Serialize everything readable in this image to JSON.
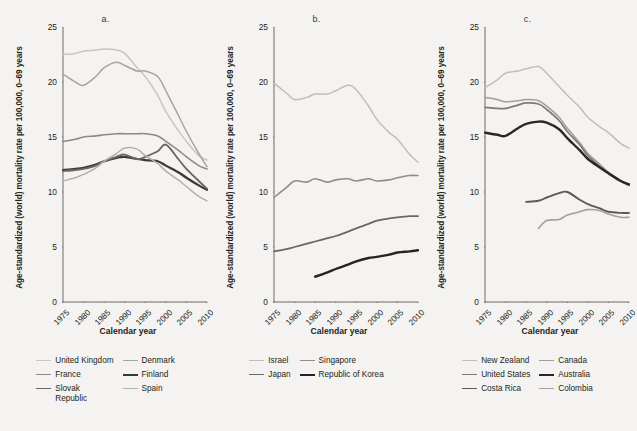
{
  "figure": {
    "background": "#f4f3f1",
    "axis_color": "#6f6b68"
  },
  "shared": {
    "ylabel": "Age-standardized (world) mortality rate per 100,000, 0–69 years",
    "xlabel": "Calendar year",
    "yticks": [
      "0",
      "5",
      "10",
      "15",
      "20",
      "25"
    ],
    "xticks": [
      "1975",
      "1980",
      "1985",
      "1990",
      "1995",
      "2000",
      "2005",
      "2010"
    ]
  },
  "panels": [
    {
      "id": "a",
      "label": "a."
    },
    {
      "id": "b",
      "label": "b."
    },
    {
      "id": "c",
      "label": "c."
    }
  ],
  "chart_data": [
    {
      "type": "line",
      "panel": "a.",
      "title": "a.",
      "xlabel": "Calendar year",
      "ylabel": "Age-standardized (world) mortality rate per 100,000, 0–69 years",
      "xlim": [
        1975,
        2010
      ],
      "ylim": [
        0,
        25
      ],
      "grid": false,
      "legend_position": "below",
      "x": [
        1975,
        1978,
        1980,
        1983,
        1985,
        1988,
        1990,
        1993,
        1995,
        1998,
        2000,
        2003,
        2005,
        2008,
        2010
      ],
      "series": [
        {
          "name": "United Kingdom",
          "color": "#c8c6c3",
          "values": [
            22.5,
            22.6,
            22.8,
            22.9,
            23.0,
            22.9,
            22.6,
            21.3,
            20.5,
            18.8,
            17.3,
            15.6,
            14.6,
            13.3,
            12.9
          ]
        },
        {
          "name": "Denmark",
          "color": "#a7a5a2",
          "values": [
            20.7,
            20.0,
            19.7,
            20.5,
            21.3,
            21.8,
            21.5,
            21.0,
            21.0,
            20.5,
            19.2,
            17.0,
            15.5,
            13.5,
            12.3
          ]
        },
        {
          "name": "France",
          "color": "#8c8a88",
          "values": [
            14.6,
            14.8,
            15.0,
            15.1,
            15.2,
            15.3,
            15.3,
            15.3,
            15.3,
            15.1,
            14.6,
            13.8,
            13.2,
            12.4,
            12.1
          ]
        },
        {
          "name": "Finland",
          "color": "#3a3836",
          "values": [
            12.0,
            12.1,
            12.2,
            12.5,
            12.8,
            13.1,
            13.2,
            13.0,
            12.9,
            12.8,
            12.4,
            11.8,
            11.3,
            10.6,
            10.2
          ]
        },
        {
          "name": "Slovak Republic",
          "color": "#6a6866",
          "values": [
            11.9,
            12.0,
            12.1,
            12.4,
            12.8,
            13.2,
            13.4,
            13.0,
            13.2,
            13.7,
            14.3,
            13.0,
            12.1,
            11.0,
            10.3
          ]
        },
        {
          "name": "Spain",
          "color": "#b2b0ad",
          "values": [
            11.0,
            11.3,
            11.6,
            12.2,
            12.8,
            13.5,
            14.0,
            13.9,
            13.3,
            12.6,
            11.9,
            11.1,
            10.5,
            9.6,
            9.2
          ]
        }
      ]
    },
    {
      "type": "line",
      "panel": "b.",
      "title": "b.",
      "xlabel": "Calendar year",
      "ylabel": "Age-standardized (world) mortality rate per 100,000, 0–69 years",
      "xlim": [
        1975,
        2010
      ],
      "ylim": [
        0,
        25
      ],
      "grid": false,
      "legend_position": "below",
      "x": [
        1975,
        1978,
        1980,
        1983,
        1985,
        1988,
        1990,
        1993,
        1995,
        1998,
        2000,
        2003,
        2005,
        2008,
        2010
      ],
      "series": [
        {
          "name": "Israel",
          "color": "#c0bebb",
          "values": [
            19.9,
            19.0,
            18.4,
            18.6,
            18.9,
            18.9,
            19.2,
            19.7,
            19.3,
            17.8,
            16.6,
            15.4,
            14.8,
            13.4,
            12.7
          ]
        },
        {
          "name": "Singapore",
          "color": "#8f8d8a",
          "values": [
            9.5,
            10.4,
            11.0,
            10.9,
            11.2,
            10.9,
            11.1,
            11.2,
            11.0,
            11.2,
            11.0,
            11.1,
            11.3,
            11.5,
            11.5
          ]
        },
        {
          "name": "Japan",
          "color": "#6a6866",
          "values": [
            4.6,
            4.8,
            5.0,
            5.3,
            5.5,
            5.8,
            6.0,
            6.4,
            6.7,
            7.1,
            7.4,
            7.6,
            7.7,
            7.8,
            7.8
          ]
        },
        {
          "name": "Republic of Korea",
          "color": "#262422",
          "values": [
            null,
            null,
            null,
            null,
            2.3,
            2.7,
            3.0,
            3.4,
            3.7,
            4.0,
            4.1,
            4.3,
            4.5,
            4.6,
            4.7
          ]
        }
      ]
    },
    {
      "type": "line",
      "panel": "c.",
      "title": "c.",
      "xlabel": "Calendar year",
      "ylabel": "Age-standardized (world) mortality rate per 100,000, 0–69 years",
      "xlim": [
        1975,
        2010
      ],
      "ylim": [
        0,
        25
      ],
      "grid": false,
      "legend_position": "below",
      "x": [
        1975,
        1978,
        1980,
        1983,
        1985,
        1988,
        1990,
        1993,
        1995,
        1998,
        2000,
        2003,
        2005,
        2008,
        2010
      ],
      "series": [
        {
          "name": "New Zealand",
          "color": "#c0bebb",
          "values": [
            19.5,
            20.2,
            20.8,
            21.0,
            21.2,
            21.4,
            20.8,
            19.6,
            18.8,
            17.7,
            16.8,
            15.9,
            15.4,
            14.4,
            14.0
          ]
        },
        {
          "name": "Canada",
          "color": "#a09e9b",
          "values": [
            18.6,
            18.4,
            18.2,
            18.3,
            18.4,
            18.3,
            17.8,
            16.8,
            15.8,
            14.5,
            13.5,
            12.5,
            11.8,
            11.0,
            10.7
          ]
        },
        {
          "name": "United States",
          "color": "#7c7a77",
          "values": [
            17.7,
            17.6,
            17.6,
            17.9,
            18.1,
            18.0,
            17.5,
            16.5,
            15.5,
            14.3,
            13.3,
            12.3,
            11.7,
            11.0,
            10.6
          ]
        },
        {
          "name": "Australia",
          "color": "#2a2826",
          "values": [
            15.4,
            15.2,
            15.1,
            15.8,
            16.2,
            16.4,
            16.3,
            15.7,
            14.9,
            13.8,
            13.0,
            12.2,
            11.7,
            11.0,
            10.7
          ]
        },
        {
          "name": "Costa Rica",
          "color": "#5c5a58",
          "values": [
            null,
            null,
            null,
            null,
            9.1,
            9.2,
            9.5,
            9.9,
            10.0,
            9.3,
            8.9,
            8.5,
            8.2,
            8.1,
            8.1
          ]
        },
        {
          "name": "Colombia",
          "color": "#a3a19e",
          "values": [
            null,
            null,
            null,
            null,
            null,
            6.7,
            7.4,
            7.5,
            7.9,
            8.2,
            8.4,
            8.3,
            8.0,
            7.7,
            7.7
          ]
        }
      ]
    }
  ],
  "legends": [
    {
      "panel": "a.",
      "items": [
        {
          "label": "United Kingdom",
          "color": "#c8c6c3",
          "weight": 1.5
        },
        {
          "label": "Denmark",
          "color": "#a7a5a2",
          "weight": 1.5
        },
        {
          "label": "France",
          "color": "#8c8a88",
          "weight": 1.6
        },
        {
          "label": "Finland",
          "color": "#3a3836",
          "weight": 2.2
        },
        {
          "label": "Slovak\nRepublic",
          "color": "#6a6866",
          "weight": 1.9
        },
        {
          "label": "Spain",
          "color": "#b2b0ad",
          "weight": 1.5
        }
      ]
    },
    {
      "panel": "b.",
      "items": [
        {
          "label": "Israel",
          "color": "#c0bebb",
          "weight": 1.5
        },
        {
          "label": "Singapore",
          "color": "#8f8d8a",
          "weight": 1.6
        },
        {
          "label": "Japan",
          "color": "#6a6866",
          "weight": 1.8
        },
        {
          "label": "Republic of Korea",
          "color": "#262422",
          "weight": 2.4
        }
      ]
    },
    {
      "panel": "c.",
      "items": [
        {
          "label": "New Zealand",
          "color": "#c0bebb",
          "weight": 1.5
        },
        {
          "label": "Canada",
          "color": "#a09e9b",
          "weight": 1.5
        },
        {
          "label": "United States",
          "color": "#7c7a77",
          "weight": 1.7
        },
        {
          "label": "Australia",
          "color": "#2a2826",
          "weight": 2.4
        },
        {
          "label": "Costa Rica",
          "color": "#5c5a58",
          "weight": 1.9
        },
        {
          "label": "Colombia",
          "color": "#a3a19e",
          "weight": 1.6
        }
      ]
    }
  ]
}
